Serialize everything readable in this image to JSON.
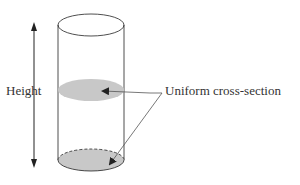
{
  "diagram": {
    "height_label": "Height",
    "cross_section_label": "Uniform cross-section",
    "colors": {
      "stroke": "#222222",
      "fill": "#c8c8c8",
      "arrow": "#555555"
    }
  }
}
